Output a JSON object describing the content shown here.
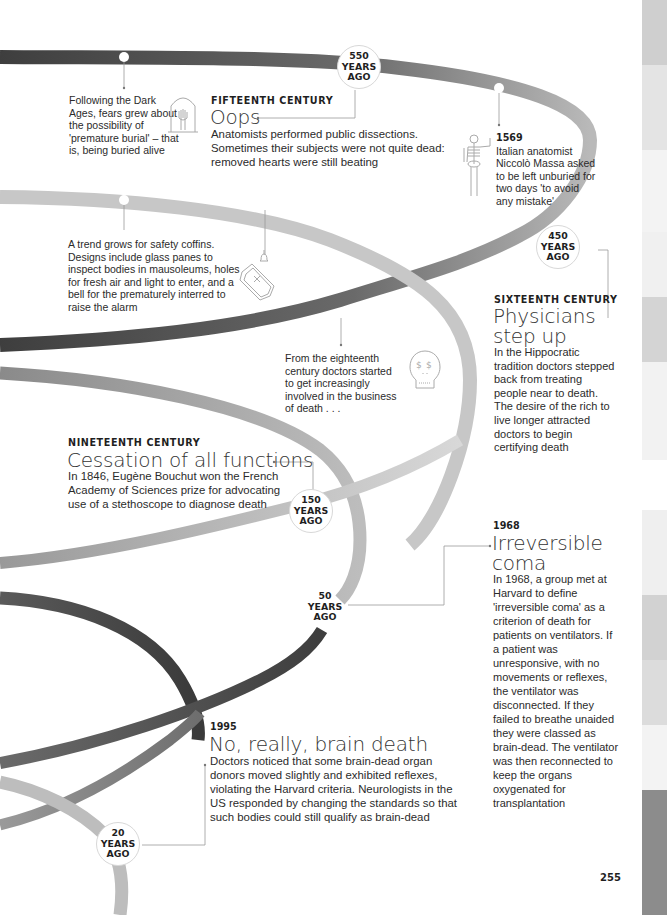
{
  "page_number": "255",
  "colors": {
    "band_dark": "#4a4a4a",
    "band_mid": "#8a8a8a",
    "band_light": "#c4c4c4",
    "text": "#2b2b2b",
    "connector": "#999999"
  },
  "side_tabs": [
    {
      "top": 0,
      "height": 65,
      "color": "#cfcfcf"
    },
    {
      "top": 65,
      "height": 85,
      "color": "#e4e4e4"
    },
    {
      "top": 150,
      "height": 82,
      "color": "#f3f3f3"
    },
    {
      "top": 232,
      "height": 65,
      "color": "#f0f0f0"
    },
    {
      "top": 297,
      "height": 65,
      "color": "#d4d4d4"
    },
    {
      "top": 362,
      "height": 98,
      "color": "#f2f2f2"
    },
    {
      "top": 460,
      "height": 50,
      "color": "#ffffff"
    },
    {
      "top": 510,
      "height": 85,
      "color": "#efefef"
    },
    {
      "top": 595,
      "height": 65,
      "color": "#d2d2d2"
    },
    {
      "top": 660,
      "height": 65,
      "color": "#dcdcdc"
    },
    {
      "top": 725,
      "height": 65,
      "color": "#f3f3f3"
    },
    {
      "top": 790,
      "height": 125,
      "color": "#8c8c8c"
    }
  ],
  "badges": [
    {
      "id": "550",
      "line1": "550",
      "line2": "YEARS",
      "line3": "AGO"
    },
    {
      "id": "450",
      "line1": "450",
      "line2": "YEARS",
      "line3": "AGO"
    },
    {
      "id": "150",
      "line1": "150",
      "line2": "YEARS",
      "line3": "AGO"
    },
    {
      "id": "50",
      "line1": "50",
      "line2": "YEARS",
      "line3": "AGO"
    },
    {
      "id": "20",
      "line1": "20",
      "line2": "YEARS",
      "line3": "AGO"
    }
  ],
  "notes": {
    "dark_ages": "Following the Dark Ages, fears grew about the possibility of 'premature burial' – that is, being buried alive",
    "safety_coffins": "A trend grows for safety coffins. Designs include glass panes to inspect bodies in mausoleums, holes for fresh air and light to enter, and a bell for the prematurely interred to raise the alarm",
    "eighteenth_century": "From the eighteenth century doctors started to get increasingly involved in the business of death . . ."
  },
  "entries": {
    "fifteenth": {
      "kicker": "FIFTEENTH CENTURY",
      "headline": "Oops",
      "body": "Anatomists performed public dissections. Sometimes their subjects were not quite dead: removed hearts were still beating"
    },
    "y1569": {
      "year": "1569",
      "body": "Italian anatomist Niccolò Massa asked to be left unburied for two days 'to avoid any mistake'"
    },
    "sixteenth": {
      "kicker": "SIXTEENTH CENTURY",
      "headline_line1": "Physicians",
      "headline_line2": "step up",
      "body": "In the Hippocratic tradition doctors stepped back from treating people near to death. The desire of the rich to live longer attracted doctors to begin certifying death"
    },
    "nineteenth": {
      "kicker": "NINETEENTH CENTURY",
      "headline": "Cessation of all functions",
      "body": "In 1846, Eugène Bouchut won the French Academy of Sciences prize for advocating use of a stethoscope to diagnose death"
    },
    "y1968": {
      "year": "1968",
      "headline_line1": "Irreversible",
      "headline_line2": "coma",
      "body": "In 1968, a group met at Harvard to define 'irreversible coma' as a criterion of death for patients on ventilators. If a patient was unresponsive, with no movements or reflexes, the ventilator was disconnected. If they failed to breathe unaided they were classed as brain-dead. The ventilator was then reconnected to keep the organs oxygenated for transplantation"
    },
    "y1995": {
      "year": "1995",
      "headline": "No, really, brain death",
      "body": "Doctors noticed that some brain-dead organ donors moved slightly and exhibited reflexes, violating the Harvard criteria. Neurologists in the US responded by changing the standards so that such bodies could still qualify as brain-dead"
    }
  },
  "icons": [
    "tombstone-hand-icon",
    "skeleton-icon",
    "coffin-bell-icon",
    "dollar-skull-icon"
  ]
}
